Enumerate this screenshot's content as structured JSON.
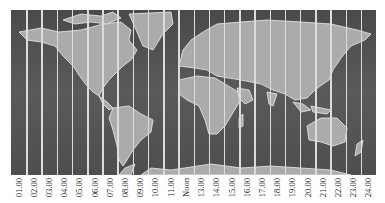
{
  "map": {
    "title": "World time zones",
    "colors": {
      "ocean": "#505050",
      "land": "#ababab",
      "zone_line": "#dcdcdc",
      "border": "#eeeeee"
    }
  },
  "time_zones": {
    "labels": [
      "01.00",
      "02.00",
      "03.00",
      "04.00",
      "05.00",
      "06.00",
      "07.00",
      "08.00",
      "09.00",
      "10.00",
      "11.00",
      "Noon",
      "13.00",
      "14.00",
      "15.00",
      "16.00",
      "17.00",
      "18.00",
      "19.00",
      "20.00",
      "21.00",
      "22.00",
      "23.00",
      "24.00"
    ]
  }
}
